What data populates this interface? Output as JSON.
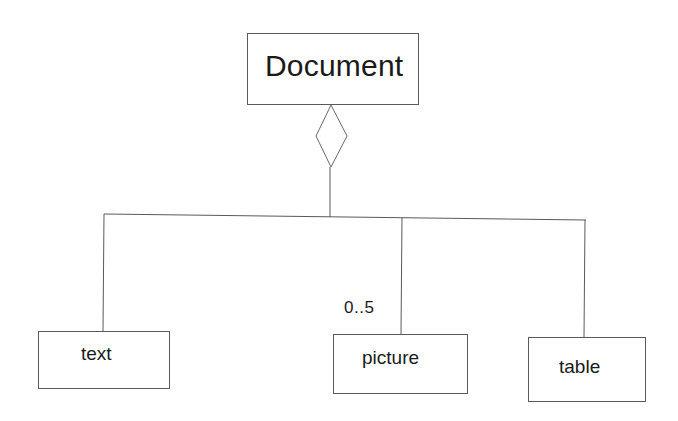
{
  "diagram": {
    "type": "UML aggregation",
    "parent": {
      "label": "Document"
    },
    "relationship": {
      "kind": "aggregation",
      "symbol": "hollow-diamond"
    },
    "children": [
      {
        "label": "text",
        "multiplicity": ""
      },
      {
        "label": "picture",
        "multiplicity": "0..5"
      },
      {
        "label": "table",
        "multiplicity": ""
      }
    ]
  },
  "colors": {
    "background": "#ffffff",
    "line": "#5a5a5a",
    "text": "#1a1a1a"
  }
}
